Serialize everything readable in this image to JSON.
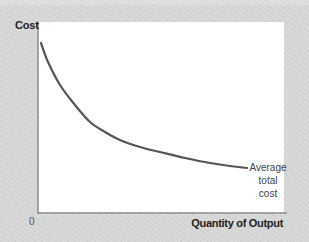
{
  "chart_data": {
    "type": "line",
    "title": "",
    "xlabel": "Quantity of Output",
    "ylabel": "Cost",
    "origin_label": "0",
    "grid": false,
    "legend": null,
    "series": [
      {
        "name": "Average total cost",
        "label_lines": [
          "Average",
          "total",
          "cost"
        ],
        "color": "#555555",
        "description": "Downward-sloping, convex curve (declining average total cost)",
        "points_px": [
          [
            41,
            43
          ],
          [
            48,
            62
          ],
          [
            60,
            85
          ],
          [
            75,
            105
          ],
          [
            90,
            122
          ],
          [
            105,
            132
          ],
          [
            120,
            140
          ],
          [
            140,
            147
          ],
          [
            160,
            152
          ],
          [
            185,
            158
          ],
          [
            210,
            163
          ],
          [
            230,
            166
          ],
          [
            247,
            168
          ]
        ]
      }
    ],
    "xticks": [],
    "yticks": [],
    "annotations": [
      {
        "text": "Average total cost",
        "position": "end of curve, right"
      }
    ]
  },
  "colors": {
    "background": "#d8d8d8",
    "plot_background": "#ffffff",
    "axis": "#888888",
    "curve": "#555555"
  }
}
